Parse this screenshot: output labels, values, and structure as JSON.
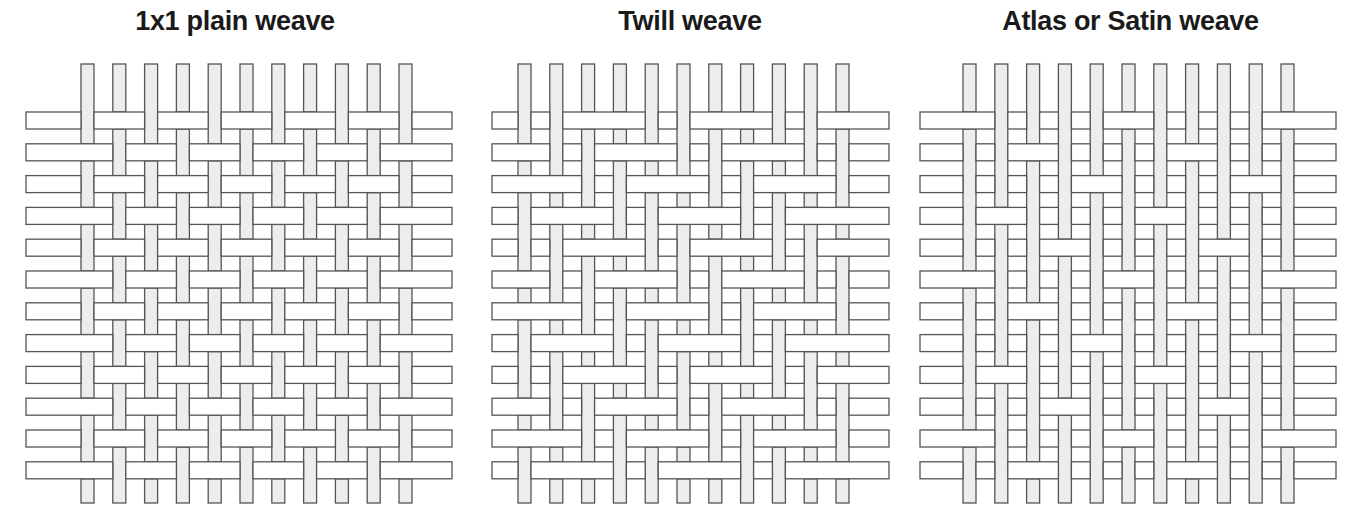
{
  "figure": {
    "background": "#ffffff",
    "width": 1351,
    "height": 517,
    "caption_marker": ""
  },
  "style": {
    "warp_fill": "#ededed",
    "weft_fill": "#ffffff",
    "stroke": "#555555",
    "stroke_width": 1.3,
    "title_color": "#1a1a1a",
    "title_size": 27
  },
  "panels": [
    {
      "id": "plain",
      "title": "1x1 plain weave",
      "title_x": 240,
      "geometry": {
        "warp_count": 11,
        "weft_count": 12,
        "warp_x0": 81,
        "warp_pitch": 31.8,
        "warp_width": 13,
        "warp_y0": 64,
        "warp_y1": 503,
        "weft_y0": 112,
        "weft_pitch": 31.8,
        "weft_height": 17,
        "weft_x0": 26,
        "weft_x1": 452
      },
      "pattern_type": "plain",
      "pattern_note": "Warp up when (row + col) is even; alternating 1-over-1-under in both directions.",
      "float_length": 1
    },
    {
      "id": "twill",
      "title": "Twill weave",
      "title_x": 699,
      "geometry": {
        "warp_count": 11,
        "weft_count": 12,
        "warp_x0": 518,
        "warp_pitch": 31.8,
        "warp_width": 13,
        "warp_y0": 64,
        "warp_y1": 503,
        "weft_y0": 112,
        "weft_pitch": 31.8,
        "weft_height": 17,
        "weft_x0": 492,
        "weft_x1": 889
      },
      "pattern_type": "twill",
      "pattern_note": "2/2 twill: warp up when ((col - row) mod 4) is 0 or 1, producing a 45 degree diagonal rib.",
      "float_length": 2
    },
    {
      "id": "satin",
      "title": "Atlas or Satin weave",
      "title_x": 1152,
      "geometry": {
        "warp_count": 11,
        "weft_count": 12,
        "warp_x0": 963,
        "warp_pitch": 31.8,
        "warp_width": 13,
        "warp_y0": 64,
        "warp_y1": 503,
        "weft_y0": 112,
        "weft_pitch": 31.8,
        "weft_height": 17,
        "weft_x0": 920,
        "weft_x1": 1336
      },
      "pattern_type": "satin",
      "pattern_note": "5-harness satin with move number 2: weft appears on top only when ((col - 2*row) mod 5) is 0; warp floats elsewhere.",
      "satin_harness": 5,
      "satin_move": 2,
      "float_length": 4
    }
  ],
  "legend": {
    "warp_label": "warp thread (vertical, shaded)",
    "weft_label": "weft thread (horizontal, white)"
  }
}
